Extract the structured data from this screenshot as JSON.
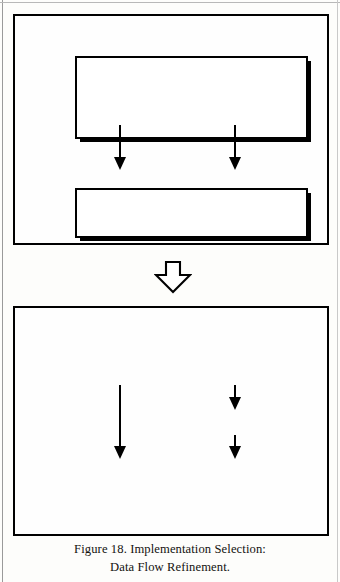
{
  "figure": {
    "caption_line1": "Figure 18. Implementation Selection:",
    "caption_line2": "Data Flow Refinement.",
    "ink_color": "#000000",
    "paper_color": "#fdfdfb"
  },
  "panels": [
    {
      "id": "before",
      "name": "before-refinement-panel",
      "boxes": [
        {
          "id": "b-top",
          "name": "source-process-box",
          "label": ""
        },
        {
          "id": "b-bottom",
          "name": "sink-process-box",
          "label": ""
        }
      ],
      "arrows": [
        {
          "id": "b-arrow-left",
          "name": "data-flow-arrow-left",
          "label": ""
        },
        {
          "id": "b-arrow-right",
          "name": "data-flow-arrow-right",
          "label": ""
        }
      ]
    },
    {
      "id": "after",
      "name": "after-refinement-panel",
      "boxes": [
        {
          "id": "a-top",
          "name": "source-process-box",
          "label": ""
        },
        {
          "id": "a-mid",
          "name": "inserted-transform-box",
          "label": ""
        },
        {
          "id": "a-bottom",
          "name": "sink-process-box",
          "label": ""
        }
      ],
      "arrows": [
        {
          "id": "a-arrow-left",
          "name": "data-flow-arrow-left",
          "label": ""
        },
        {
          "id": "a-arrow-to-mid",
          "name": "data-flow-arrow-to-transform",
          "label": ""
        },
        {
          "id": "a-arrow-from-mid",
          "name": "data-flow-arrow-from-transform",
          "label": ""
        }
      ]
    }
  ],
  "transition": {
    "name": "refinement-transition-arrow",
    "direction": "down",
    "style": "hollow-block-arrow"
  }
}
